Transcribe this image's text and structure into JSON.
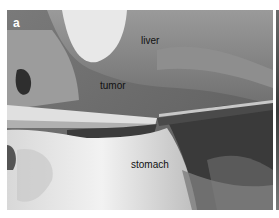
{
  "figure": {
    "panel_letter": "a",
    "labels": {
      "liver": "liver",
      "tumor": "tumor",
      "stomach": "stomach"
    }
  }
}
